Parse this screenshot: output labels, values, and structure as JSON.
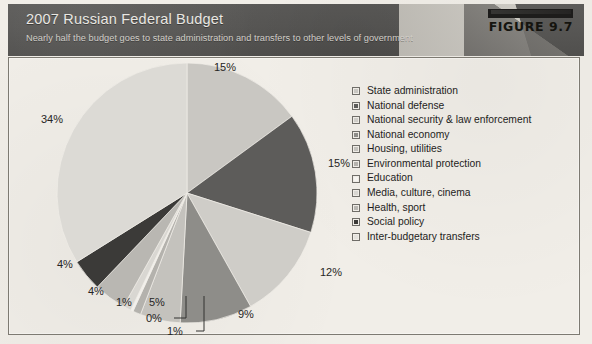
{
  "header": {
    "title": "2007 Russian Federal Budget",
    "subtitle": "Nearly half the budget goes to state administration and transfers to other levels of government",
    "figure_label": "FIGURE 9.7",
    "bar_color": "#1d1c1b",
    "background_color": "#58575 5"
  },
  "chart_data": {
    "type": "pie",
    "title": "2007 Russian Federal Budget",
    "subtitle": "Nearly half the budget goes to state administration and transfers to other levels of government",
    "unit": "percent",
    "start_angle_deg": 0,
    "direction": "clockwise",
    "legend_position": "right",
    "grid": false,
    "categories": [
      "State administration",
      "National defense",
      "National security & law enforcement",
      "National economy",
      "Housing, utilities",
      "Environmental protection",
      "Education",
      "Media, culture, cinema",
      "Health, sport",
      "Social policy",
      "Inter-budgetary transfers"
    ],
    "values": [
      15,
      15,
      12,
      9,
      5,
      1,
      0,
      1,
      4,
      4,
      34
    ],
    "labels": [
      "15%",
      "15%",
      "12%",
      "9%",
      "5%",
      "1%",
      "0%",
      "1%",
      "4%",
      "4%",
      "34%"
    ],
    "colors": [
      "#c9c7c2",
      "#5d5c5a",
      "#cfcdc8",
      "#8e8d89",
      "#c4c2bd",
      "#b4b2ad",
      "#f2f0ec",
      "#d9d7d2",
      "#b9b7b2",
      "#3b3a38",
      "#dcdad5"
    ],
    "slices": [
      {
        "name": "State administration",
        "value": 15,
        "label": "15%",
        "color": "#c9c7c2",
        "leader": false
      },
      {
        "name": "National defense",
        "value": 15,
        "label": "15%",
        "color": "#5d5c5a",
        "leader": false
      },
      {
        "name": "National security & law enforcement",
        "value": 12,
        "label": "12%",
        "color": "#cfcdc8",
        "leader": false
      },
      {
        "name": "National economy",
        "value": 9,
        "label": "9%",
        "color": "#8e8d89",
        "leader": false
      },
      {
        "name": "Housing, utilities",
        "value": 5,
        "label": "5%",
        "color": "#c4c2bd",
        "leader": false
      },
      {
        "name": "Environmental protection",
        "value": 1,
        "label": "1%",
        "color": "#b4b2ad",
        "leader": true
      },
      {
        "name": "Education",
        "value": 0,
        "label": "0%",
        "color": "#f2f0ec",
        "leader": true
      },
      {
        "name": "Media, culture, cinema",
        "value": 1,
        "label": "1%",
        "color": "#d9d7d2",
        "leader": false
      },
      {
        "name": "Health, sport",
        "value": 4,
        "label": "4%",
        "color": "#b9b7b2",
        "leader": false
      },
      {
        "name": "Social policy",
        "value": 4,
        "label": "4%",
        "color": "#3b3a38",
        "leader": false
      },
      {
        "name": "Inter-budgetary transfers",
        "value": 34,
        "label": "34%",
        "color": "#dcdad5",
        "leader": false
      }
    ]
  },
  "legend": {
    "items": [
      {
        "label": "State administration",
        "color": "#c9c7c2"
      },
      {
        "label": "National defense",
        "color": "#5d5c5a"
      },
      {
        "label": "National security & law enforcement",
        "color": "#cfcdc8"
      },
      {
        "label": "National economy",
        "color": "#8e8d89"
      },
      {
        "label": "Housing, utilities",
        "color": "#c4c2bd"
      },
      {
        "label": "Environmental protection",
        "color": "#b4b2ad"
      },
      {
        "label": "Education",
        "color": "#f6f4f0"
      },
      {
        "label": "Media, culture, cinema",
        "color": "#d9d7d2"
      },
      {
        "label": "Health, sport",
        "color": "#b9b7b2"
      },
      {
        "label": "Social policy",
        "color": "#3b3a38"
      },
      {
        "label": "Inter-budgetary transfers",
        "color": "#e4e2dd"
      }
    ]
  }
}
